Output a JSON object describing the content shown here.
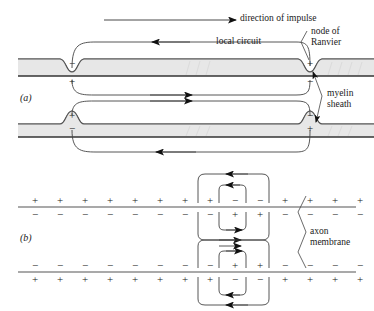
{
  "figure": {
    "title_alt": "Saltatory conduction along a myelinated axon",
    "background_color": "#ffffff",
    "ink_color": "#1a1a1a",
    "myelin_fill_color": "#e4e4e4",
    "membrane_line_color": "#555555",
    "width": 374,
    "height": 311
  },
  "labels": {
    "direction_of_impulse": "direction of impulse",
    "local_circuit": "local circuit",
    "node_of_ranvier_line1": "node of",
    "node_of_ranvier_line2": "Ranvier",
    "myelin_line1": "myelin",
    "myelin_line2": "sheath",
    "axon_line1": "axon",
    "axon_line2": "membrane",
    "panel_a": "(a)",
    "panel_b": "(b)"
  },
  "panel_a": {
    "name": "myelinated-axon-local-circuits",
    "axons": [
      {
        "name": "upper-axon",
        "node_left_sign": "−",
        "node_left_outer_sign": "+",
        "node_right_sign": "+",
        "node_right_outer_sign": "−",
        "node_direction": "down"
      },
      {
        "name": "lower-axon",
        "node_left_sign": "−",
        "node_left_outer_sign": "+",
        "node_right_sign": "+",
        "node_right_outer_sign": "−",
        "node_direction": "up"
      }
    ],
    "arrows": [
      {
        "name": "impulse-direction-arrow",
        "direction": "right"
      },
      {
        "name": "upper-loop-arrow",
        "direction": "left"
      },
      {
        "name": "upper-return-arrow",
        "direction": "right"
      },
      {
        "name": "lower-outer-arrow",
        "direction": "right"
      },
      {
        "name": "lower-loop-arrow",
        "direction": "left"
      }
    ]
  },
  "panel_b": {
    "name": "axon-membrane-charge-distribution",
    "membranes": [
      {
        "name": "upper-membrane",
        "outside_signs": [
          "+",
          "+",
          "+",
          "+",
          "+",
          "+",
          "+",
          "+",
          "−",
          "−",
          "+",
          "+",
          "+",
          "+"
        ],
        "inside_signs": [
          "−",
          "−",
          "−",
          "−",
          "−",
          "−",
          "−",
          "−",
          "+",
          "+",
          "−",
          "−",
          "−",
          "−"
        ]
      },
      {
        "name": "lower-membrane",
        "outside_signs": [
          "−",
          "−",
          "−",
          "−",
          "−",
          "−",
          "−",
          "−",
          "+",
          "+",
          "−",
          "−",
          "−",
          "−"
        ],
        "inside_signs": [
          "+",
          "+",
          "+",
          "+",
          "+",
          "+",
          "+",
          "+",
          "−",
          "−",
          "+",
          "+",
          "+",
          "+"
        ]
      }
    ],
    "current_loops": [
      {
        "name": "upper-outer-loop",
        "arrow_direction": "left"
      },
      {
        "name": "upper-inner-loop",
        "arrow_direction": "left"
      },
      {
        "name": "upper-inside-outer-loop",
        "arrow_direction": "right"
      },
      {
        "name": "upper-inside-inner-loop",
        "arrow_direction": "right"
      },
      {
        "name": "lower-inside-outer-loop",
        "arrow_direction": "right"
      },
      {
        "name": "lower-inside-inner-loop",
        "arrow_direction": "right"
      },
      {
        "name": "lower-outer-loop",
        "arrow_direction": "left"
      },
      {
        "name": "lower-inner-loop",
        "arrow_direction": "left"
      }
    ]
  }
}
